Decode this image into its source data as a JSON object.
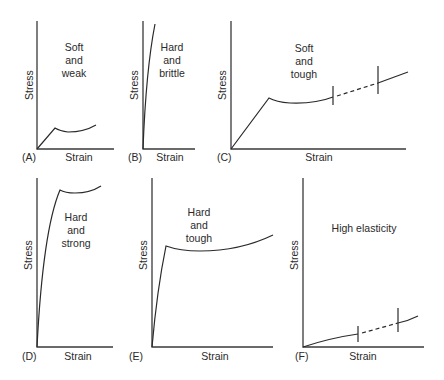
{
  "figure": {
    "panels": [
      {
        "id": "A",
        "letter": "(A)",
        "x_label": "Strain",
        "y_label": "Stress",
        "annotation": [
          "Soft",
          "and",
          "weak"
        ]
      },
      {
        "id": "B",
        "letter": "(B)",
        "x_label": "Strain",
        "y_label": "Stress",
        "annotation": [
          "Hard",
          "and",
          "brittle"
        ]
      },
      {
        "id": "C",
        "letter": "(C)",
        "x_label": "Strain",
        "y_label": "Stress",
        "annotation": [
          "Soft",
          "and",
          "tough"
        ]
      },
      {
        "id": "D",
        "letter": "(D)",
        "x_label": "Strain",
        "y_label": "Stress",
        "annotation": [
          "Hard",
          "and",
          "strong"
        ]
      },
      {
        "id": "E",
        "letter": "(E)",
        "x_label": "Strain",
        "y_label": "Stress",
        "annotation": [
          "Hard",
          "and",
          "tough"
        ]
      },
      {
        "id": "F",
        "letter": "(F)",
        "x_label": "Strain",
        "y_label": "Stress",
        "annotation": [
          "High elasticity"
        ]
      }
    ]
  }
}
